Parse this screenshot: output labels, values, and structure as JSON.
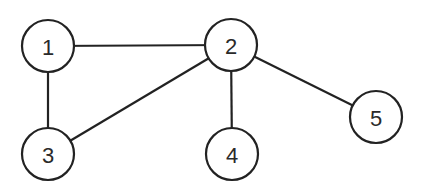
{
  "graph": {
    "nodes": [
      {
        "id": "1",
        "label": "1",
        "cx": 48,
        "cy": 46
      },
      {
        "id": "2",
        "label": "2",
        "cx": 231,
        "cy": 45
      },
      {
        "id": "3",
        "label": "3",
        "cx": 48,
        "cy": 154
      },
      {
        "id": "4",
        "label": "4",
        "cx": 232,
        "cy": 154
      },
      {
        "id": "5",
        "label": "5",
        "cx": 376,
        "cy": 117
      }
    ],
    "edges": [
      {
        "from": "1",
        "to": "2"
      },
      {
        "from": "1",
        "to": "3"
      },
      {
        "from": "2",
        "to": "3"
      },
      {
        "from": "2",
        "to": "4"
      },
      {
        "from": "2",
        "to": "5"
      }
    ],
    "node_radius": 26
  }
}
